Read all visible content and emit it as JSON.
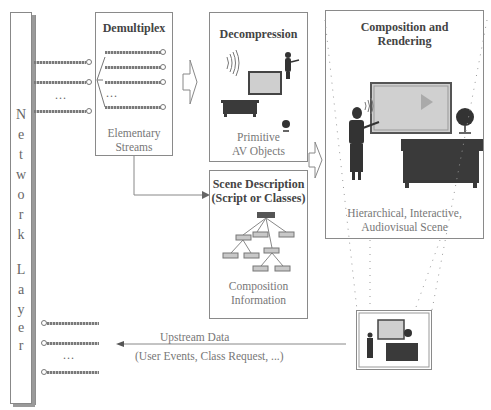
{
  "network_layer": {
    "label_top": [
      "N",
      "e",
      "t",
      "w",
      "o",
      "r",
      "k"
    ],
    "label_bottom": [
      "L",
      "a",
      "y",
      "e",
      "r"
    ]
  },
  "demultiplex": {
    "title": "Demultiplex",
    "caption_line1": "Elementary",
    "caption_line2": "Streams",
    "ellipsis": "..."
  },
  "incoming_streams": {
    "ellipsis": "..."
  },
  "decompression": {
    "title": "Decompression",
    "caption_line1": "Primitive",
    "caption_line2": "AV Objects"
  },
  "scene_description": {
    "title_line1": "Scene Description",
    "title_line2": "(Script or Classes)",
    "caption_line1": "Composition",
    "caption_line2": "Information"
  },
  "composition": {
    "title_line1": "Composition and",
    "title_line2": "Rendering",
    "caption_line1": "Hierarchical, Interactive,",
    "caption_line2": "Audiovisual Scene"
  },
  "upstream": {
    "label": "Upstream Data",
    "sublabel": "(User Events, Class Request, ...)",
    "ellipsis": "..."
  },
  "colors": {
    "line": "#8a8a8a",
    "screen_fill": "#cfcfcf",
    "dark_object": "#3a3a3a"
  }
}
